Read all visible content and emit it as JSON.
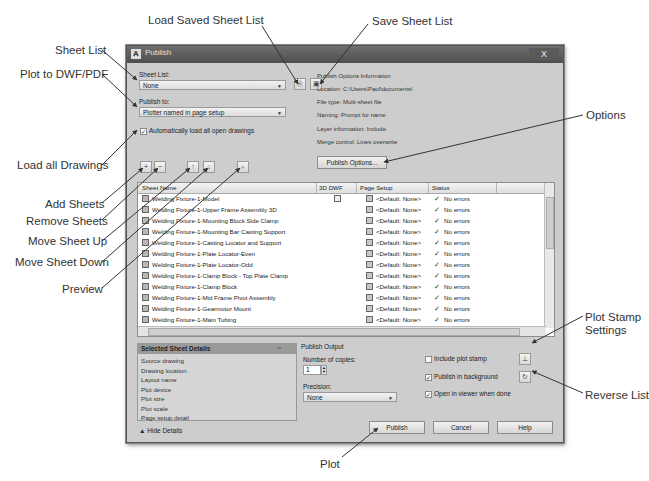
{
  "callouts": {
    "load_saved_sheet_list": "Load Saved Sheet List",
    "save_sheet_list": "Save Sheet List",
    "sheet_list": "Sheet List",
    "plot_to_dwf_pdf": "Plot to DWF/PDF",
    "load_all_drawings": "Load all Drawings",
    "options": "Options",
    "add_sheets": "Add Sheets",
    "remove_sheets": "Remove Sheets",
    "move_sheet_up": "Move Sheet Up",
    "move_sheet_down": "Move Sheet Down",
    "preview": "Preview",
    "plot_stamp_settings_line1": "Plot Stamp",
    "plot_stamp_settings_line2": "Settings",
    "reverse_list": "Reverse List",
    "plot": "Plot"
  },
  "dialog": {
    "title": "Publish",
    "close_label": "X",
    "sheet_list": {
      "label": "Sheet List:",
      "value": "None"
    },
    "publish_to": {
      "label": "Publish to:",
      "value": "Plotter named in page setup"
    },
    "auto_load": {
      "label": "Automatically load all open drawings",
      "checked": true
    },
    "publish_options_info": {
      "heading": "Publish Options Information",
      "location": "Location: C:\\Users\\Paul\\documents\\",
      "file_type": "File type: Multi-sheet file",
      "naming": "Naming: Prompt for name",
      "layer_information": "Layer information: Include",
      "merge_control": "Merge control: Lines overwrite"
    },
    "publish_options_button": "Publish Options...",
    "table": {
      "columns": [
        "Sheet Name",
        "3D DWF",
        "Page Setup",
        "Status"
      ],
      "rows": [
        {
          "name": "Welding Fixture-1-Model",
          "dwf3d": true,
          "page_setup": "<Default: None>",
          "status": "No errors"
        },
        {
          "name": "Welding Fixture-1-Upper Frame Assembly 3D",
          "dwf3d": false,
          "page_setup": "<Default: None>",
          "status": "No errors"
        },
        {
          "name": "Welding Fixture-1-Mounting Block Side Clamp",
          "dwf3d": false,
          "page_setup": "<Default: None>",
          "status": "No errors"
        },
        {
          "name": "Welding Fixture-1-Mounting Bar Casting Support",
          "dwf3d": false,
          "page_setup": "<Default: None>",
          "status": "No errors"
        },
        {
          "name": "Welding Fixture-1-Casting Locator and Support",
          "dwf3d": false,
          "page_setup": "<Default: None>",
          "status": "No errors"
        },
        {
          "name": "Welding Fixture-1-Plate Locator-Even",
          "dwf3d": false,
          "page_setup": "<Default: None>",
          "status": "No errors"
        },
        {
          "name": "Welding Fixture-1-Plate Locator-Odd",
          "dwf3d": false,
          "page_setup": "<Default: None>",
          "status": "No errors"
        },
        {
          "name": "Welding Fixture-1-Clamp Block - Top Plate Clamp",
          "dwf3d": false,
          "page_setup": "<Default: None>",
          "status": "No errors"
        },
        {
          "name": "Welding Fixture-1-Clamp Block",
          "dwf3d": false,
          "page_setup": "<Default: None>",
          "status": "No errors"
        },
        {
          "name": "Welding Fixture-1-Mid Frame Pivot Assembly",
          "dwf3d": false,
          "page_setup": "<Default: None>",
          "status": "No errors"
        },
        {
          "name": "Welding Fixture-1-Gearmotor Mount",
          "dwf3d": false,
          "page_setup": "<Default: None>",
          "status": "No errors"
        },
        {
          "name": "Welding Fixture-1-Main Tubing",
          "dwf3d": false,
          "page_setup": "<Default: None>",
          "status": "No errors"
        }
      ]
    },
    "selected_sheet_details": {
      "heading": "Selected Sheet Details",
      "items": [
        "Source drawing",
        "Drawing location",
        "Layout name",
        "Plot device",
        "Plot size",
        "Plot scale",
        "Page setup detail"
      ]
    },
    "publish_output": {
      "heading": "Publish Output",
      "copies_label": "Number of copies:",
      "copies_value": "1",
      "precision_label": "Precision:",
      "precision_value": "None",
      "include_plot_stamp": {
        "label": "Include plot stamp",
        "checked": false
      },
      "publish_in_background": {
        "label": "Publish in background",
        "checked": true
      },
      "open_in_viewer": {
        "label": "Open in viewer when done",
        "checked": true
      }
    },
    "hide_details": "Hide Details",
    "buttons": {
      "publish": "Publish",
      "cancel": "Cancel",
      "help": "Help"
    }
  }
}
